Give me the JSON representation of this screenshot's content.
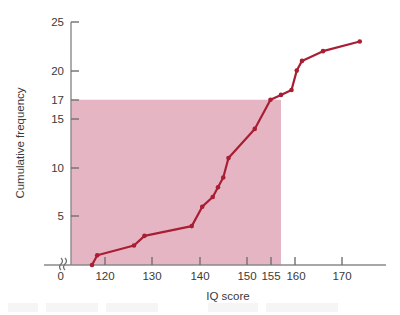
{
  "chart_data": {
    "type": "line",
    "title": "",
    "xlabel": "IQ score",
    "ylabel": "Cumulative frequency",
    "xlim": [
      115,
      175
    ],
    "ylim": [
      0,
      25
    ],
    "grid": false,
    "legend": "none",
    "x_ticks": [
      120,
      130,
      140,
      150,
      155,
      160,
      170
    ],
    "x_tick_labels": [
      "120",
      "130",
      "140",
      "150",
      "155",
      "160",
      "170"
    ],
    "x_origin_label": "0",
    "x_axis_break": true,
    "x_axis_break_glyph": "axis-break-squiggle",
    "y_ticks": [
      0,
      5,
      10,
      15,
      17,
      20,
      25
    ],
    "y_tick_labels": [
      "0",
      "5",
      "10",
      "15",
      "17",
      "20",
      "25"
    ],
    "series": [
      {
        "name": "Cumulative frequency",
        "marker": "circle",
        "color": "#a81e32",
        "x": [
          119,
          120,
          127,
          129,
          138,
          140,
          142,
          143,
          144,
          145,
          150,
          153,
          155,
          157,
          158,
          159,
          163,
          170
        ],
        "y": [
          0,
          1,
          2,
          3,
          4,
          6,
          7,
          8,
          9,
          11,
          14,
          17,
          17.5,
          18,
          20,
          21,
          22,
          23
        ]
      }
    ],
    "shaded_region": {
      "name": "median-reference-block",
      "x_from": 115,
      "x_to": 155,
      "y_from": 0,
      "y_to": 17,
      "color": "#e6b5c3"
    },
    "reference_lines": {
      "y_value": 17,
      "x_value": 155
    }
  },
  "axes": {
    "y_title": "Cumulative frequency",
    "x_title": "IQ score"
  },
  "colors": {
    "line": "#a81e32",
    "shade": "#e6b5c3",
    "axis": "#8a8a8a",
    "text": "#3a3a3a",
    "background": "#ffffff"
  }
}
